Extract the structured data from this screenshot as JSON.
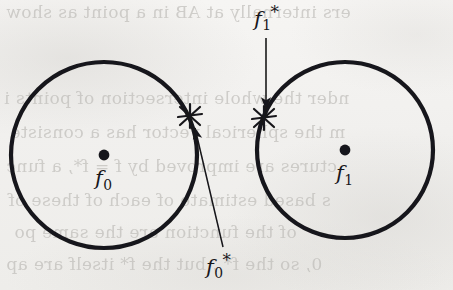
{
  "figure": {
    "kind": "geometry-diagram",
    "background_color": "#f3f2f0",
    "ink_color": "#17161a",
    "ghost_text_color": "#b9b7b3"
  },
  "labels": {
    "center_left": {
      "base": "f",
      "sub": "0",
      "sup": ""
    },
    "center_right": {
      "base": "f",
      "sub": "1",
      "sup": ""
    },
    "point_left": {
      "base": "f",
      "sub": "0",
      "sup": "*"
    },
    "point_right": {
      "base": "f",
      "sub": "1",
      "sup": "*"
    }
  },
  "shapes": {
    "circle_left": {
      "cx": 104,
      "cy": 155,
      "r": 93,
      "stroke_width": 4.2
    },
    "circle_right": {
      "cx": 345,
      "cy": 150,
      "r": 88,
      "stroke_width": 4.2
    },
    "center_dot_left": {
      "cx": 104,
      "cy": 155,
      "r": 5.4
    },
    "center_dot_right": {
      "cx": 345,
      "cy": 150,
      "r": 5.4
    },
    "star_left": {
      "cx": 190,
      "cy": 116,
      "r": 13
    },
    "star_right": {
      "cx": 264,
      "cy": 118,
      "r": 13
    }
  },
  "arrows": {
    "to_point_left": {
      "x1": 223,
      "y1": 247,
      "x2": 194,
      "y2": 127,
      "label": "arrow from f0* label up to star on left circle"
    },
    "to_point_right": {
      "x1": 266,
      "y1": 38,
      "x2": 266,
      "y2": 110,
      "label": "arrow from f1* label down to star on right circle"
    }
  },
  "ghost_text": {
    "lines": [
      {
        "text": "ers internally at AB in a point as show",
        "left": 6,
        "top": 2,
        "size": 17
      },
      {
        "text": "nder the whole intersection of points i",
        "left": 4,
        "top": 88,
        "size": 17
      },
      {
        "text": "m the spherical vector has a consiste",
        "left": 10,
        "top": 122,
        "size": 17
      },
      {
        "text": "ctures are improved by f = f*, a func",
        "left": 6,
        "top": 156,
        "size": 17
      },
      {
        "text": "s based estimate of each of these of",
        "left": 8,
        "top": 190,
        "size": 17
      },
      {
        "text": "of the function are the same po",
        "left": 14,
        "top": 222,
        "size": 17
      },
      {
        "text": "0, so the f* , but the f* itself are ap",
        "left": 6,
        "top": 254,
        "size": 17
      }
    ]
  }
}
